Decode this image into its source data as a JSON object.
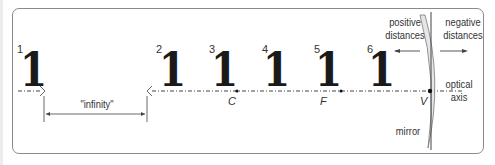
{
  "diagram": {
    "objects": [
      {
        "index": "1",
        "glyph": "1",
        "x": 20
      },
      {
        "index": "2",
        "glyph": "1",
        "x": 159
      },
      {
        "index": "3",
        "glyph": "1",
        "x": 211
      },
      {
        "index": "4",
        "glyph": "1",
        "x": 263
      },
      {
        "index": "5",
        "glyph": "1",
        "x": 315
      },
      {
        "index": "6",
        "glyph": "1",
        "x": 368
      }
    ],
    "points": [
      {
        "label": "C",
        "x": 228
      },
      {
        "label": "F",
        "x": 320
      },
      {
        "label": "V",
        "x": 420
      }
    ],
    "labels": {
      "infinity": "\"infinity\"",
      "positive_line1": "positive",
      "positive_line2": "distances",
      "negative_line1": "negative",
      "negative_line2": "distances",
      "optical_line1": "optical",
      "optical_line2": "axis",
      "mirror": "mirror"
    },
    "colors": {
      "stroke": "#333333",
      "mirror_fill": "#e6e6e6",
      "frame": "#8a8a8a"
    }
  }
}
